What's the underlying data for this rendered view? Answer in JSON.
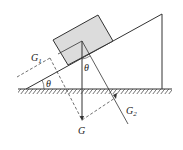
{
  "diagram": {
    "type": "inclined-plane-force-decomposition",
    "labels": {
      "G": "G",
      "G1": "G",
      "G1_sub": "1",
      "G2": "G",
      "G2_sub": "2",
      "theta_base": "θ",
      "theta_top": "θ"
    },
    "colors": {
      "line": "#333333",
      "block_fill": "#dcdcdc",
      "background": "#ffffff"
    }
  }
}
